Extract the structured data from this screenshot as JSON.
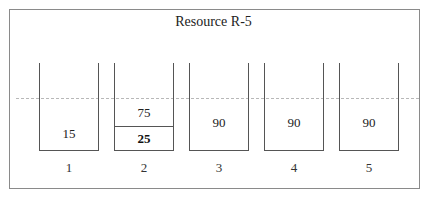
{
  "title": "Resource R-5",
  "bins": [
    {
      "label": "1",
      "value": "15"
    },
    {
      "label": "2",
      "value": "75",
      "sub_value": "25"
    },
    {
      "label": "3",
      "value": "90"
    },
    {
      "label": "4",
      "value": "90"
    },
    {
      "label": "5",
      "value": "90"
    }
  ],
  "threshold_line": {
    "style": "dashed",
    "color": "#b8b8b8"
  }
}
